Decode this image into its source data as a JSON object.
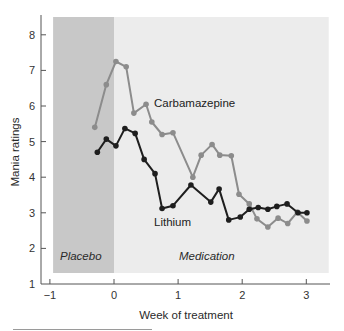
{
  "chart_data": {
    "type": "line",
    "title": "",
    "xlabel": "Week of treatment",
    "ylabel": "Mania ratings",
    "xlim": [
      -1.05,
      3.35
    ],
    "ylim": [
      1,
      8.5
    ],
    "xticks": [
      -1,
      0,
      1,
      2,
      3
    ],
    "xtick_labels": [
      "−1",
      "0",
      "1",
      "2",
      "3"
    ],
    "yticks": [
      1,
      2,
      3,
      4,
      5,
      6,
      7,
      8
    ],
    "ytick_labels": [
      "1",
      "2",
      "3",
      "4",
      "5",
      "6",
      "7",
      "8"
    ],
    "grid": false,
    "legend": "none (inline series labels)",
    "regions": [
      {
        "name": "Placebo",
        "x_start": -0.95,
        "x_end": 0,
        "color": "#c8c8c8"
      },
      {
        "name": "Medication",
        "x_start": 0,
        "x_end": 3.35,
        "color": "#ececec"
      }
    ],
    "series": [
      {
        "name": "Carbamazepine",
        "color": "#8c8c8c",
        "x": [
          -0.3,
          -0.12,
          0.03,
          0.19,
          0.31,
          0.5,
          0.59,
          0.75,
          0.92,
          1.23,
          1.36,
          1.53,
          1.65,
          1.83,
          1.95,
          2.11,
          2.23,
          2.4,
          2.56,
          2.71,
          2.86,
          3.01
        ],
        "values": [
          5.4,
          6.6,
          7.25,
          7.1,
          5.8,
          6.05,
          5.55,
          5.2,
          5.25,
          4.0,
          4.62,
          4.92,
          4.62,
          4.6,
          3.52,
          3.25,
          2.83,
          2.6,
          2.85,
          2.7,
          3.02,
          2.77
        ]
      },
      {
        "name": "Lithium",
        "color": "#1e1e1e",
        "x": [
          -0.26,
          -0.12,
          0.03,
          0.17,
          0.33,
          0.47,
          0.64,
          0.75,
          0.92,
          1.2,
          1.51,
          1.64,
          1.79,
          1.97,
          2.11,
          2.25,
          2.4,
          2.54,
          2.7,
          2.87,
          3.01
        ],
        "values": [
          4.7,
          5.07,
          4.88,
          5.37,
          5.23,
          4.5,
          4.1,
          3.12,
          3.2,
          3.78,
          3.3,
          3.67,
          2.8,
          2.88,
          3.1,
          3.15,
          3.1,
          3.18,
          3.25,
          3.0,
          3.0
        ]
      }
    ],
    "annotations": [
      {
        "text": "Carbamazepine",
        "x": 0.72,
        "y": 5.9
      },
      {
        "text": "Lithium",
        "x": 0.62,
        "y": 2.75
      },
      {
        "text": "Placebo",
        "x": -0.92,
        "y": 1.8,
        "style": "italic"
      },
      {
        "text": "Medication",
        "x": 1.0,
        "y": 1.8,
        "style": "italic"
      }
    ]
  },
  "labels": {
    "xlabel": "Week of treatment",
    "ylabel": "Mania ratings",
    "carbamazepine": "Carbamazepine",
    "lithium": "Lithium",
    "placebo": "Placebo",
    "medication": "Medication"
  }
}
